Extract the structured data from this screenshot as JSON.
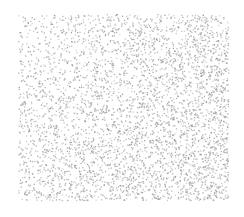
{
  "chart_data": {
    "type": "scatter",
    "title": "",
    "xlabel": "",
    "ylabel": "",
    "legend": [],
    "grid": false,
    "axes_visible": false,
    "plot_area": {
      "x": 18,
      "y": 14,
      "width": 210,
      "height": 186
    },
    "point_color": "#9a9a9a",
    "point_opacity": 0.75,
    "point_size": 1.3,
    "point_count": 4200,
    "density_gradient": "increases toward right and bottom",
    "seed": 12345
  }
}
